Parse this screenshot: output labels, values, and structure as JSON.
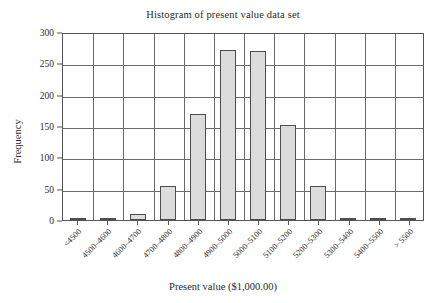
{
  "chart_data": {
    "type": "bar",
    "title": "Histogram of present value data set",
    "xlabel": "Present value ($1,000.00)",
    "ylabel": "Frequency",
    "categories": [
      "<4500",
      "4500–4600",
      "4600–4700",
      "4700–4800",
      "4800–4900",
      "4900–5000",
      "5000–5100",
      "5100–5200",
      "5200–5300",
      "5300–5400",
      "5400–5500",
      "> 5500"
    ],
    "values": [
      0,
      1,
      10,
      54,
      169,
      272,
      269,
      151,
      54,
      3,
      1,
      0
    ],
    "ylim": [
      0,
      300
    ],
    "yticks": [
      0,
      50,
      100,
      150,
      200,
      250,
      300
    ],
    "grid": "both",
    "legend": "none",
    "bar_fill": "#dcdcdc",
    "bar_border": "#4d4d4d"
  }
}
